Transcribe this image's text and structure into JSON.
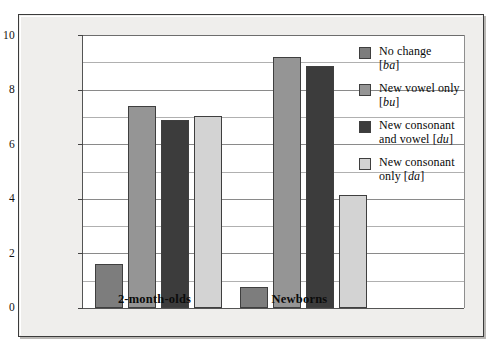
{
  "chart_data": {
    "type": "bar",
    "title": "",
    "xlabel": "",
    "ylabel": "Mean change in postshift sucking",
    "ylim": [
      0,
      10
    ],
    "yticks": [
      0,
      2,
      4,
      6,
      8,
      10
    ],
    "ytick_labels": [
      "0",
      "2",
      "4",
      "6",
      "8",
      "10"
    ],
    "minor_gridlines": [
      1,
      3,
      5,
      7,
      9
    ],
    "grid": true,
    "legend_position": "right",
    "categories": [
      "2-month-olds",
      "Newborns"
    ],
    "series": [
      {
        "name": "No change [ba]",
        "values": [
          1.6,
          0.78
        ],
        "color": "#7d7d7d"
      },
      {
        "name": "New vowel only [bu]",
        "values": [
          7.4,
          9.2
        ],
        "color": "#959595"
      },
      {
        "name": "New consonant and vowel [du]",
        "values": [
          6.9,
          8.85
        ],
        "color": "#3c3c3c"
      },
      {
        "name": "New consonant only [da]",
        "values": [
          7.05,
          4.15
        ],
        "color": "#d3d3d3"
      }
    ]
  },
  "axes": {
    "y_title": "Mean change in postshift sucking",
    "y_tick_labels": [
      "10",
      "8",
      "6",
      "4",
      "2",
      "0"
    ],
    "x_group_labels": [
      "2-month-olds",
      "Newborns"
    ]
  },
  "legend": {
    "items": [
      {
        "label_main": "No change",
        "label_code": "[ba]",
        "code_italic": "ba",
        "swatch": "#7d7d7d"
      },
      {
        "label_main": "New vowel only",
        "label_code": "[bu]",
        "code_italic": "bu",
        "swatch": "#959595"
      },
      {
        "label_main": "New consonant",
        "label_code": "and vowel [du]",
        "code_italic": "du",
        "swatch": "#3c3c3c"
      },
      {
        "label_main": "New consonant",
        "label_code": "only [da]",
        "code_italic": "da",
        "swatch": "#d3d3d3"
      }
    ]
  },
  "colors": {
    "panel_bg": "#efeeec",
    "plot_bg": "#ffffff",
    "frame": "#3b3b3b",
    "gridline": "#9a9a9a",
    "bar_outline": "#3f3f3f"
  }
}
